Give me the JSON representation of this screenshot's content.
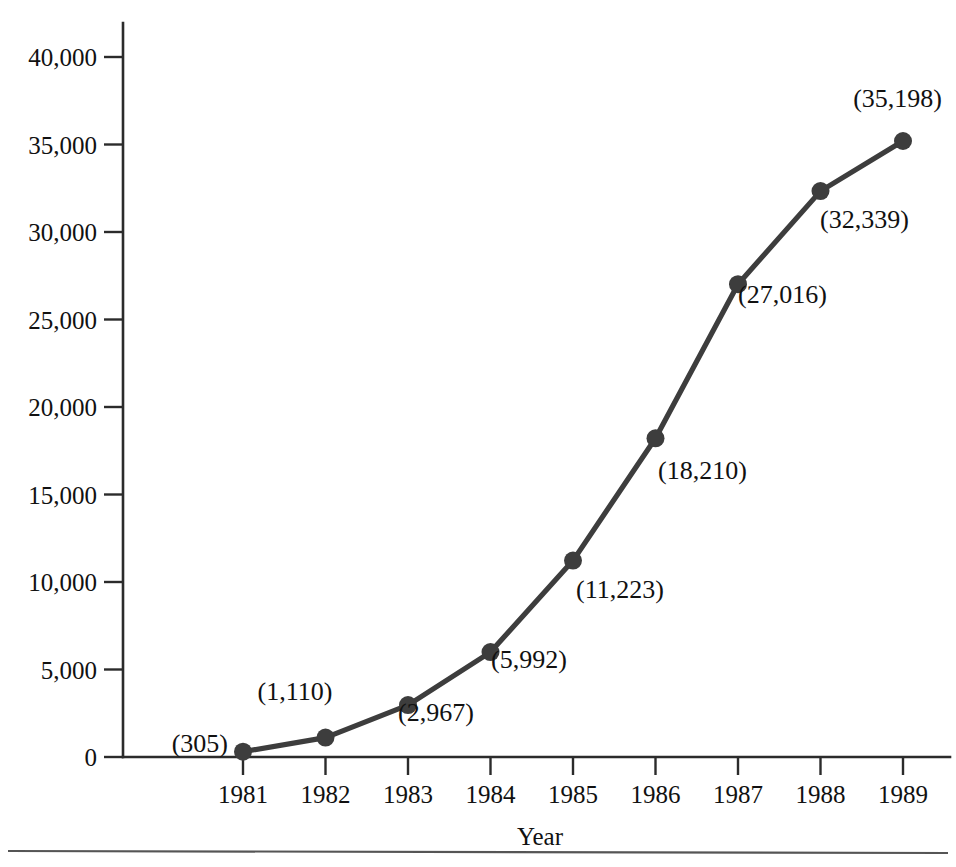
{
  "chart_data": {
    "type": "line",
    "title": "",
    "xlabel": "Year",
    "ylabel": "",
    "categories": [
      "1981",
      "1982",
      "1983",
      "1984",
      "1985",
      "1986",
      "1987",
      "1988",
      "1989"
    ],
    "x": [
      1981,
      1982,
      1983,
      1984,
      1985,
      1986,
      1987,
      1988,
      1989
    ],
    "values": [
      305,
      1110,
      2967,
      5992,
      11223,
      18210,
      27016,
      32339,
      35198
    ],
    "point_labels": [
      "(305)",
      "(1,110)",
      "(2,967)",
      "(5,992)",
      "(11,223)",
      "(18,210)",
      "(27,016)",
      "(32,339)",
      "(35,198)"
    ],
    "label_positions": [
      "left",
      "above-left",
      "below-right",
      "below-right",
      "below-right",
      "below-right",
      "below-right",
      "below-right",
      "above-left"
    ],
    "ylim": [
      0,
      40000
    ],
    "xlim": [
      1980.5,
      1989.5
    ],
    "y_ticks": [
      0,
      5000,
      10000,
      15000,
      20000,
      25000,
      30000,
      35000,
      40000
    ],
    "y_tick_labels": [
      "0",
      "5,000",
      "10,000",
      "15,000",
      "20,000",
      "25,000",
      "30,000",
      "35,000",
      "40,000"
    ],
    "grid": false,
    "legend": false,
    "legend_position": "none",
    "series_color": "#3d3d3d",
    "axis_color": "#2b2b2b",
    "background_color": "#ffffff",
    "marker": "circle"
  },
  "axes": {
    "x_title": "Year",
    "y_title": ""
  }
}
